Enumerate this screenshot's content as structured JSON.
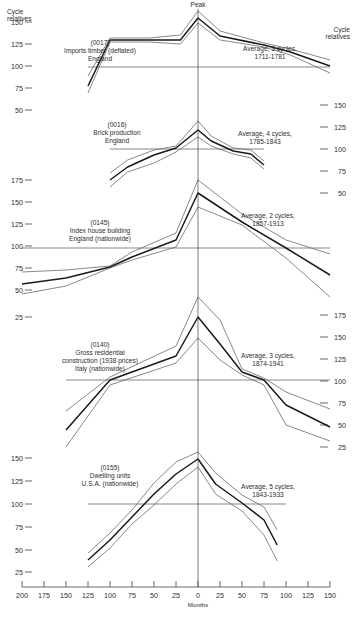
{
  "chart_data": {
    "type": "line",
    "title": "",
    "peak_label": "Peak",
    "xlabel": "Months",
    "x_ticks": [
      -200,
      -175,
      -150,
      -125,
      -100,
      -75,
      -50,
      -25,
      0,
      25,
      50,
      75,
      100,
      125,
      150
    ],
    "x_tick_labels": [
      "200",
      "175",
      "150",
      "125",
      "100",
      "75",
      "50",
      "25",
      "0",
      "25",
      "50",
      "75",
      "100",
      "125",
      "150"
    ],
    "xlim": [
      -200,
      150
    ],
    "left_axis": {
      "title_line1": "Cycle",
      "title_line2": "relatives",
      "ticks": [
        {
          "label": "150",
          "y": 22
        },
        {
          "label": "125",
          "y": 44
        },
        {
          "label": "100",
          "y": 66
        },
        {
          "label": "75",
          "y": 88
        },
        {
          "label": "50",
          "y": 110
        },
        {
          "label": "175",
          "y": 180
        },
        {
          "label": "150",
          "y": 202
        },
        {
          "label": "125",
          "y": 224
        },
        {
          "label": "100",
          "y": 246
        },
        {
          "label": "75",
          "y": 268
        },
        {
          "label": "50",
          "y": 290
        },
        {
          "label": "25",
          "y": 317
        },
        {
          "label": "150",
          "y": 458
        },
        {
          "label": "125",
          "y": 481
        },
        {
          "label": "100",
          "y": 504
        },
        {
          "label": "75",
          "y": 527
        },
        {
          "label": "50",
          "y": 550
        },
        {
          "label": "25",
          "y": 572
        }
      ]
    },
    "right_axis": {
      "title_line1": "Cycle",
      "title_line2": "relatives",
      "ticks": [
        {
          "label": "150",
          "y": 105
        },
        {
          "label": "125",
          "y": 127
        },
        {
          "label": "100",
          "y": 149
        },
        {
          "label": "75",
          "y": 171
        },
        {
          "label": "50",
          "y": 193
        },
        {
          "label": "175",
          "y": 315
        },
        {
          "label": "150",
          "y": 337
        },
        {
          "label": "125",
          "y": 359
        },
        {
          "label": "100",
          "y": 381
        },
        {
          "label": "75",
          "y": 403
        },
        {
          "label": "50",
          "y": 425
        },
        {
          "label": "25",
          "y": 447
        }
      ]
    },
    "panels": [
      {
        "id": "(0017)",
        "name_lines": [
          "(0017)",
          "Imports timber (deflated)",
          "England"
        ],
        "average_lines": [
          "Average, 3 cycles,",
          "1711-1781"
        ],
        "baseline_y": 67,
        "baseline_x": [
          -125,
          150
        ],
        "label_pos": {
          "x": 100,
          "y": 45
        },
        "avg_pos": {
          "x": 270,
          "y": 51
        },
        "x": [
          -125,
          -100,
          -55,
          -20,
          0,
          25,
          75,
          105,
          150
        ],
        "series": [
          {
            "name": "upper",
            "values": [
              113,
              92,
              91,
              111,
              131,
              112,
              103,
              98,
              82
            ]
          },
          {
            "name": "average",
            "values": [
              108,
              91,
              89,
              106,
              127,
              106,
              100,
              93,
              74
            ]
          },
          {
            "name": "lower",
            "values": [
              104,
              90,
              87,
              102,
              122,
              103,
              98,
              89,
              68
            ]
          }
        ],
        "series_y_px": {
          "upper": [
            76,
            38,
            38,
            35,
            11,
            31,
            43,
            49,
            60
          ],
          "average": [
            86,
            40,
            40,
            40,
            18,
            36,
            45,
            52,
            66
          ],
          "lower": [
            93,
            42,
            42,
            44,
            23,
            40,
            47,
            55,
            73
          ]
        }
      },
      {
        "id": "(0016)",
        "name_lines": [
          "(0016)",
          "Brick production",
          "England"
        ],
        "average_lines": [
          "Average, 4 cycles,",
          "1785-1843"
        ],
        "baseline_y": 149,
        "baseline_x": [
          -100,
          75
        ],
        "label_pos": {
          "x": 117,
          "y": 127
        },
        "avg_pos": {
          "x": 265,
          "y": 136
        },
        "x": [
          -100,
          -80,
          -50,
          -25,
          0,
          15,
          40,
          60,
          75
        ],
        "series": [
          {
            "name": "upper",
            "values": [
              66,
              89,
              107,
              115,
              166,
              123,
              101,
              99,
              80
            ]
          },
          {
            "name": "average",
            "values": [
              58,
              80,
              97,
              110,
              145,
              117,
              98,
              90,
              76
            ]
          },
          {
            "name": "lower",
            "values": [
              51,
              73,
              87,
              103,
              124,
              110,
              92,
              84,
              72
            ]
          }
        ],
        "series_y_px": {
          "upper": [
            173,
            160,
            150,
            146,
            121,
            136,
            148,
            150,
            161
          ],
          "average": [
            180,
            167,
            155,
            148,
            130,
            141,
            151,
            154,
            165
          ],
          "lower": [
            187,
            172,
            163,
            152,
            137,
            146,
            154,
            158,
            169
          ]
        }
      },
      {
        "id": "(0145)",
        "name_lines": [
          "(0145)",
          "Index house building",
          "England (nationwide)"
        ],
        "average_lines": [
          "Average, 2 cycles,",
          "1857-1913"
        ],
        "baseline_y": 248,
        "baseline_x": [
          -200,
          150
        ],
        "label_pos": {
          "x": 100,
          "y": 225
        },
        "avg_pos": {
          "x": 268,
          "y": 218
        },
        "x": [
          -200,
          -150,
          -100,
          -75,
          -25,
          0,
          50,
          100,
          150
        ],
        "series": [
          {
            "name": "upper",
            "values": [
              75,
              77,
              82,
              97,
              120,
              170,
              130,
              108,
              95
            ]
          },
          {
            "name": "average",
            "values": [
              62,
              70,
              80,
              92,
              110,
              158,
              125,
              100,
              75
            ]
          },
          {
            "name": "lower",
            "values": [
              48,
              60,
              78,
              90,
              102,
              148,
              123,
              92,
              48
            ]
          }
        ],
        "series_y_px": {
          "upper": [
            272,
            270,
            266,
            252,
            233,
            180,
            214,
            240,
            254
          ],
          "average": [
            284,
            278,
            267,
            257,
            240,
            193,
            222,
            248,
            275
          ],
          "lower": [
            294,
            286,
            268,
            260,
            247,
            207,
            225,
            258,
            297
          ]
        }
      },
      {
        "id": "(0140)",
        "name_lines": [
          "(0140)",
          "Gross residential",
          "construction (1938 prices)",
          "Italy (nationwide)"
        ],
        "average_lines": [
          "Average, 3 cycles,",
          "1874-1941"
        ],
        "baseline_y": 380,
        "baseline_x": [
          -150,
          150
        ],
        "label_pos": {
          "x": 100,
          "y": 347
        },
        "avg_pos": {
          "x": 268,
          "y": 358
        },
        "x": [
          -150,
          -100,
          -25,
          0,
          25,
          50,
          75,
          100,
          150
        ],
        "series": [
          {
            "name": "upper",
            "values": [
              65,
              103,
              140,
              178,
              150,
              109,
              97,
              80,
              62
            ]
          },
          {
            "name": "average",
            "values": [
              43,
              99,
              128,
              155,
              128,
              103,
              100,
              72,
              52
            ]
          },
          {
            "name": "lower",
            "values": [
              20,
              96,
              118,
              134,
              112,
              100,
              105,
              55,
              34
            ]
          }
        ],
        "series_y_px": {
          "upper": [
            411,
            377,
            346,
            297,
            320,
            369,
            378,
            392,
            409
          ],
          "average": [
            430,
            380,
            356,
            317,
            344,
            372,
            380,
            405,
            427
          ],
          "lower": [
            447,
            385,
            363,
            338,
            360,
            375,
            385,
            425,
            441
          ]
        }
      },
      {
        "id": "(0155)",
        "name_lines": [
          "(0155)",
          "Dwelling units",
          "U.S.A. (nationwide)"
        ],
        "average_lines": [
          "Average, 5 cycles,",
          "1843-1933"
        ],
        "baseline_y": 504,
        "baseline_x": [
          -125,
          100
        ],
        "label_pos": {
          "x": 110,
          "y": 470
        },
        "avg_pos": {
          "x": 268,
          "y": 489
        },
        "x": [
          -125,
          -100,
          -75,
          -50,
          -25,
          0,
          20,
          50,
          75,
          90
        ],
        "series": [
          {
            "name": "upper",
            "values": [
              46,
              68,
              93,
              125,
              145,
              156,
              135,
              115,
              102,
              75
            ]
          },
          {
            "name": "average",
            "values": [
              38,
              60,
              85,
              112,
              133,
              148,
              122,
              105,
              85,
              58
            ]
          },
          {
            "name": "lower",
            "values": [
              31,
              52,
              78,
              98,
              122,
              140,
              112,
              97,
              70,
              40
            ]
          }
        ],
        "series_y_px": {
          "upper": [
            553,
            533,
            510,
            483,
            462,
            452,
            473,
            495,
            507,
            530
          ],
          "average": [
            560,
            540,
            517,
            494,
            474,
            459,
            484,
            503,
            520,
            545
          ],
          "lower": [
            567,
            548,
            524,
            505,
            484,
            467,
            494,
            511,
            535,
            561
          ]
        }
      }
    ]
  }
}
